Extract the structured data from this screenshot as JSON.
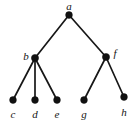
{
  "diagram": {
    "type": "graph-tree",
    "title": "",
    "width": 138,
    "height": 122,
    "background_color": "#ffffff",
    "node_color": "#111111",
    "edge_color": "#171717",
    "label_color": "#141414",
    "node_radius": 3.4,
    "edge_width": 1.7,
    "nodes": [
      {
        "id": "a",
        "label": "a",
        "x": 69,
        "y": 15,
        "label_x": 69,
        "label_y": 6,
        "r": 3.4
      },
      {
        "id": "b",
        "label": "b",
        "x": 35,
        "y": 58,
        "label_x": 26,
        "label_y": 56,
        "r": 3.6
      },
      {
        "id": "f",
        "label": "f",
        "x": 106,
        "y": 57,
        "label_x": 115,
        "label_y": 53,
        "r": 3.6
      },
      {
        "id": "c",
        "label": "c",
        "x": 13,
        "y": 100,
        "label_x": 13,
        "label_y": 114,
        "r": 3.4
      },
      {
        "id": "d",
        "label": "d",
        "x": 35,
        "y": 100,
        "label_x": 35,
        "label_y": 114,
        "r": 3.4
      },
      {
        "id": "e",
        "label": "e",
        "x": 57,
        "y": 100,
        "label_x": 57,
        "label_y": 114,
        "r": 3.4
      },
      {
        "id": "g",
        "label": "g",
        "x": 84,
        "y": 100,
        "label_x": 84,
        "label_y": 114,
        "r": 3.4
      },
      {
        "id": "h",
        "label": "h",
        "x": 124,
        "y": 97,
        "label_x": 124,
        "label_y": 112,
        "r": 3.4
      }
    ],
    "edges": [
      {
        "from": "a",
        "to": "b"
      },
      {
        "from": "a",
        "to": "f"
      },
      {
        "from": "b",
        "to": "c"
      },
      {
        "from": "b",
        "to": "d"
      },
      {
        "from": "b",
        "to": "e"
      },
      {
        "from": "f",
        "to": "g"
      },
      {
        "from": "f",
        "to": "h"
      }
    ]
  }
}
